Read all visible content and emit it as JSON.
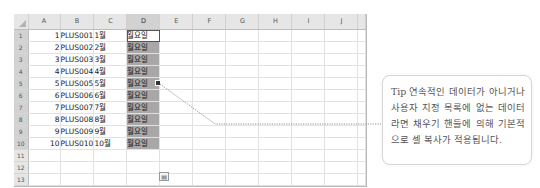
{
  "spreadsheet": {
    "column_headers": [
      "A",
      "B",
      "C",
      "D",
      "E",
      "F",
      "G",
      "H",
      "I",
      "J"
    ],
    "selected_column": "D",
    "row_numbers": [
      "1",
      "2",
      "3",
      "4",
      "5",
      "6",
      "7",
      "8",
      "9",
      "10",
      "11",
      "12",
      "13"
    ],
    "selected_range": "D1:D10",
    "active_cell": "D1",
    "rows": [
      {
        "A": "1",
        "B": "PLUS001",
        "C": "1월",
        "D": "월요일"
      },
      {
        "A": "2",
        "B": "PLUS002",
        "C": "2월",
        "D": "월요일"
      },
      {
        "A": "3",
        "B": "PLUS003",
        "C": "3월",
        "D": "월요일"
      },
      {
        "A": "4",
        "B": "PLUS004",
        "C": "4월",
        "D": "월요일"
      },
      {
        "A": "5",
        "B": "PLUS005",
        "C": "5월",
        "D": "월요일"
      },
      {
        "A": "6",
        "B": "PLUS006",
        "C": "6월",
        "D": "월요일"
      },
      {
        "A": "7",
        "B": "PLUS007",
        "C": "7월",
        "D": "월요일"
      },
      {
        "A": "8",
        "B": "PLUS008",
        "C": "8월",
        "D": "월요일"
      },
      {
        "A": "9",
        "B": "PLUS009",
        "C": "9월",
        "D": "월요일"
      },
      {
        "A": "10",
        "B": "PLUS010",
        "C": "10월",
        "D": "월요일"
      },
      {
        "A": "",
        "B": "",
        "C": "",
        "D": ""
      },
      {
        "A": "",
        "B": "",
        "C": "",
        "D": ""
      },
      {
        "A": "",
        "B": "",
        "C": "",
        "D": ""
      }
    ],
    "autofill_options_icon": "autofill-options-icon",
    "fill_handle_icon": "fill-handle-icon"
  },
  "tip": {
    "label": "Tip",
    "text": "연속적인 데이터가 아니거나 사용자 지정 목록에 없는 데이터라면 채우기 핸들에 의해 기본적으로 셀 복사가 적용됩니다."
  },
  "colors": {
    "selection": "#a8a8a8",
    "header_bg": "#e6e6e6",
    "gridline": "#e2e2e2",
    "leader_line": "#888888"
  }
}
